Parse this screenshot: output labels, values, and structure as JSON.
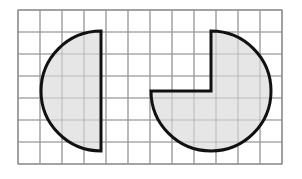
{
  "figure": {
    "title": "Two shaded circular-sector figures on a square grid",
    "canvas": {
      "width": 302,
      "height": 179,
      "background": "#ffffff"
    },
    "grid": {
      "name": "square-grid",
      "origin_x": 18,
      "origin_y": 10,
      "cell_size": 22,
      "columns": 12,
      "rows": 7,
      "line_color": "#9a9a9a",
      "line_width": 1.1,
      "border_color": "#8c8c8c",
      "border_width": 1.2
    },
    "style": {
      "shape_fill": "#e6e6e6",
      "shape_stroke": "#111111",
      "shape_stroke_width": 3.0
    },
    "shapes": [
      {
        "id": "left-semicircle",
        "label": "Left half-circle (semicircle)",
        "type": "semicircle",
        "center_x": 101,
        "center_y": 91,
        "radius": 60,
        "start_angle_deg": 90,
        "end_angle_deg": 270,
        "sweep_deg": 180,
        "fraction_of_circle": "1/2",
        "flat_edge": "vertical-right",
        "path": "M 101 31 A 60 60 0 0 0 101 151 Z"
      },
      {
        "id": "right-three-quarter-circle",
        "label": "Right three-quarter circle (upper-left quadrant removed)",
        "type": "circular-sector",
        "center_x": 211,
        "center_y": 91,
        "radius": 60,
        "start_angle_deg": 270,
        "end_angle_deg": 180,
        "sweep_deg": 270,
        "fraction_of_circle": "3/4",
        "notch": "upper-left-quadrant",
        "path": "M 211 31 A 60 60 0 1 1 151 91 L 211 91 Z"
      }
    ]
  }
}
